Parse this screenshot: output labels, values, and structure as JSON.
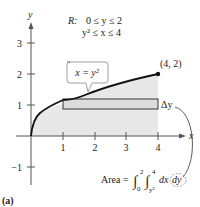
{
  "figure": {
    "label": "(a)",
    "region": {
      "name": "R:",
      "line1": "0 ≤ y ≤ 2",
      "line2": "y² ≤ x ≤ 4"
    },
    "curve_label": "x = y²",
    "point_label": "(4, 2)",
    "delta_label": "Δy",
    "area_formula": {
      "prefix": "Area =",
      "outer_lower": "0",
      "outer_upper": "2",
      "inner_lower": "y²",
      "inner_upper": "4",
      "integrand": "dx",
      "circled": "dy"
    },
    "axes": {
      "x_label": "x",
      "y_label": "y",
      "x_ticks": [
        "1",
        "2",
        "3",
        "4"
      ],
      "y_ticks": [
        "3",
        "2",
        "1",
        "−1"
      ]
    },
    "colors": {
      "region_fill": "#e6e6e6",
      "curve": "#111111",
      "axis": "#555555",
      "rect_fill": "#d9d9d9"
    }
  }
}
